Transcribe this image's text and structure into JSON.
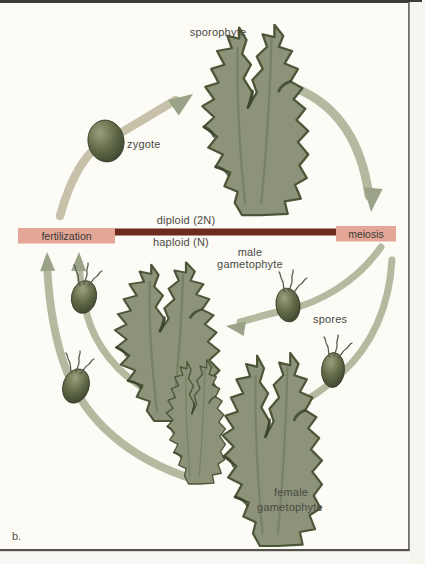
{
  "figure": {
    "letter": "b."
  },
  "labels": {
    "sporophyte": "sporophyte",
    "zygote": "zygote",
    "diploid": "diploid (2N)",
    "haploid": "haploid (N)",
    "fertilization": "fertilization",
    "meiosis": "meiosis",
    "male_gametophyte": {
      "line1": "male",
      "line2": "gametophyte"
    },
    "spores": "spores",
    "female_gametophyte": {
      "line1": "female",
      "line2": "gametophyte"
    }
  },
  "colors": {
    "background": "#fcfbf5",
    "leaf": "#8c9379",
    "leaf_edge": "#4d5638",
    "arrow": "#b3ba9f",
    "arrow_tan": "#c7c1aa",
    "arrow_head": "#9aa287",
    "box": "#e3a697",
    "bar": "#6d2a1f",
    "frame": "#3d3b36"
  }
}
